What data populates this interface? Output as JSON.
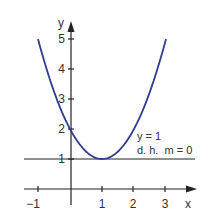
{
  "chart_data": {
    "type": "line",
    "title": "",
    "xlabel": "x",
    "ylabel": "y",
    "xlim": [
      -1.4,
      3.9
    ],
    "ylim": [
      -0.8,
      5.6
    ],
    "x_ticks": [
      "−1",
      "1",
      "2",
      "3"
    ],
    "y_ticks": [
      "1",
      "2",
      "3",
      "4",
      "5"
    ],
    "grid": false,
    "series": [
      {
        "name": "parabola y = (x − 1)² + 1",
        "x": [
          -1,
          -0.5,
          0,
          0.5,
          1,
          1.5,
          2,
          2.5,
          3
        ],
        "y": [
          5,
          3.25,
          2,
          1.25,
          1,
          1.25,
          2,
          3.25,
          5
        ],
        "color": "#2e3d8f"
      },
      {
        "name": "tangent y = 1",
        "x": [
          -1.45,
          3.9
        ],
        "y": [
          1,
          1
        ],
        "color": "#222222"
      }
    ],
    "annotations": [
      {
        "text": "y = 1",
        "x": 2.1,
        "y": 1.75
      },
      {
        "text": "d. h.  m = 0",
        "x": 2.1,
        "y": 1.3
      }
    ]
  },
  "labels": {
    "x_axis": "x",
    "y_axis": "y",
    "ann1": "y = 1",
    "ann2": "d. h.  m = 0",
    "xt_m1": "−1",
    "xt_1": "1",
    "xt_2": "2",
    "xt_3": "3",
    "yt_1": "1",
    "yt_2": "2",
    "yt_3": "3",
    "yt_4": "4",
    "yt_5": "5"
  }
}
